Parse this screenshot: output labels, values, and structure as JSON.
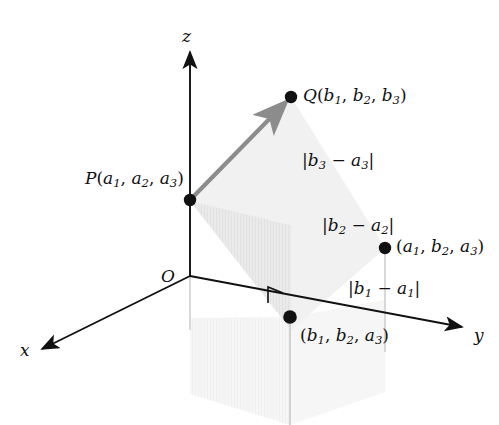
{
  "figure": {
    "type": "3d-coordinate-diagram",
    "background": "#ffffff",
    "ink_color": "#111111",
    "vector_color": "#8c8c8c",
    "fill_light": "#f1f1f1",
    "fill_mid": "#e7e7e7",
    "fill_faint": "#f5f5f5",
    "guide_color": "#c9c9c9"
  },
  "axes": [
    {
      "name": "z-axis",
      "label": "z",
      "direction": "up",
      "label_x": 182,
      "label_y": 28
    },
    {
      "name": "y-axis",
      "label": "y",
      "direction": "right-down",
      "label_x": 474,
      "label_y": 327
    },
    {
      "name": "x-axis",
      "label": "x",
      "direction": "left-down",
      "label_x": 20,
      "label_y": 342
    }
  ],
  "origin": {
    "label": "O",
    "label_x": 161,
    "label_y": 268,
    "x": 190,
    "y": 276
  },
  "points": [
    {
      "name": "point-P",
      "label_prefix": "P",
      "coords": [
        "a",
        "a",
        "a"
      ],
      "subs": [
        "1",
        "2",
        "3"
      ],
      "x": 190,
      "y": 200,
      "label_x": 85,
      "label_y": 170,
      "dot": true
    },
    {
      "name": "point-Q",
      "label_prefix": "Q",
      "coords": [
        "b",
        "b",
        "b"
      ],
      "subs": [
        "1",
        "2",
        "3"
      ],
      "x": 291,
      "y": 97,
      "label_x": 303,
      "label_y": 87,
      "dot": true
    },
    {
      "name": "point-a1b2a3",
      "label_prefix": "",
      "coords": [
        "a",
        "b",
        "a"
      ],
      "subs": [
        "1",
        "2",
        "3"
      ],
      "x": 385,
      "y": 248,
      "label_x": 396,
      "label_y": 238,
      "dot": true
    },
    {
      "name": "point-b1b2a3",
      "label_prefix": "",
      "coords": [
        "b",
        "b",
        "a"
      ],
      "subs": [
        "1",
        "2",
        "3"
      ],
      "x": 290,
      "y": 317,
      "label_x": 300,
      "label_y": 327,
      "dot": true
    }
  ],
  "segment_labels": [
    {
      "name": "segment-label-b3-a3",
      "text_parts": [
        "|b",
        "3",
        " − a",
        "3",
        "|"
      ],
      "x": 302,
      "y": 152
    },
    {
      "name": "segment-label-b2-a2",
      "text_parts": [
        "|b",
        "2",
        " − a",
        "2",
        "|"
      ],
      "x": 322,
      "y": 217
    },
    {
      "name": "segment-label-b1-a1",
      "text_parts": [
        "|b",
        "1",
        " − a",
        "1",
        "|"
      ],
      "x": 348,
      "y": 280
    }
  ],
  "annotations": {
    "right_angle_marker": {
      "name": "right-angle-marker",
      "x": 272,
      "y": 290
    },
    "vector_PQ": {
      "name": "vector-pq-arrow",
      "from": "P",
      "to": "Q"
    }
  }
}
